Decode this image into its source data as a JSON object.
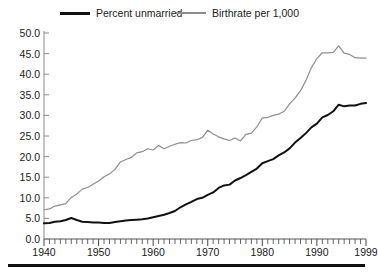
{
  "chart_data": {
    "type": "line",
    "title": "",
    "subtitle": "",
    "xlabel": "",
    "ylabel": "",
    "xlim": [
      1940,
      1999
    ],
    "ylim": [
      0.0,
      50.0
    ],
    "grid": false,
    "legend_position": "top",
    "y_ticks": [
      "50.0",
      "45.0",
      "40.0",
      "35.0",
      "30.0",
      "25.0",
      "20.0",
      "15.0",
      "10.0",
      "5.0",
      "0.0"
    ],
    "y_tick_values": [
      50.0,
      45.0,
      40.0,
      35.0,
      30.0,
      25.0,
      20.0,
      15.0,
      10.0,
      5.0,
      0.0
    ],
    "x_ticks": [
      "1940",
      "1950",
      "1960",
      "1970",
      "1980",
      "1990",
      "1999"
    ],
    "x_tick_values": [
      1940,
      1950,
      1960,
      1970,
      1980,
      1990,
      1999
    ],
    "x_minor_tick_step": 1,
    "x": [
      1940,
      1941,
      1942,
      1943,
      1944,
      1945,
      1946,
      1947,
      1948,
      1949,
      1950,
      1951,
      1952,
      1953,
      1954,
      1955,
      1956,
      1957,
      1958,
      1959,
      1960,
      1961,
      1962,
      1963,
      1964,
      1965,
      1966,
      1967,
      1968,
      1969,
      1970,
      1971,
      1972,
      1973,
      1974,
      1975,
      1976,
      1977,
      1978,
      1979,
      1980,
      1981,
      1982,
      1983,
      1984,
      1985,
      1986,
      1987,
      1988,
      1989,
      1990,
      1991,
      1992,
      1993,
      1994,
      1995,
      1996,
      1997,
      1998,
      1999
    ],
    "series": [
      {
        "name": "Percent unmarried",
        "color": "#111111",
        "width": 2.0,
        "values": [
          3.8,
          3.9,
          4.2,
          4.3,
          4.6,
          5.1,
          4.6,
          4.2,
          4.1,
          4.0,
          4.0,
          3.9,
          3.9,
          4.1,
          4.3,
          4.5,
          4.6,
          4.7,
          4.8,
          5.0,
          5.3,
          5.6,
          5.9,
          6.3,
          6.8,
          7.7,
          8.4,
          9.0,
          9.7,
          10.0,
          10.7,
          11.3,
          12.4,
          13.0,
          13.2,
          14.2,
          14.8,
          15.5,
          16.3,
          17.1,
          18.4,
          18.9,
          19.4,
          20.3,
          21.0,
          22.0,
          23.4,
          24.5,
          25.7,
          27.1,
          28.0,
          29.5,
          30.1,
          31.0,
          32.6,
          32.2,
          32.4,
          32.4,
          32.8,
          33.0
        ]
      },
      {
        "name": "Birthrate per 1,000",
        "color": "#8e8e8e",
        "width": 1.2,
        "values": [
          7.1,
          7.3,
          8.0,
          8.3,
          8.6,
          10.1,
          10.9,
          12.1,
          12.5,
          13.3,
          14.1,
          15.1,
          15.8,
          16.9,
          18.7,
          19.3,
          19.8,
          20.9,
          21.2,
          21.9,
          21.6,
          22.7,
          21.9,
          22.5,
          23.0,
          23.4,
          23.3,
          23.9,
          24.1,
          24.6,
          26.4,
          25.5,
          24.8,
          24.3,
          23.9,
          24.5,
          23.8,
          25.4,
          25.7,
          27.2,
          29.4,
          29.5,
          30.0,
          30.3,
          31.0,
          32.8,
          34.2,
          36.0,
          38.5,
          41.6,
          43.8,
          45.2,
          45.2,
          45.3,
          46.9,
          45.1,
          44.8,
          44.0,
          43.9,
          43.9
        ]
      }
    ]
  },
  "legend": {
    "entries": [
      {
        "label": "Percent unmarried"
      },
      {
        "label": "Birthrate per 1,000"
      }
    ]
  },
  "axis": {
    "y_labels": [
      "50.0",
      "45.0",
      "40.0",
      "35.0",
      "30.0",
      "25.0",
      "20.0",
      "15.0",
      "10.0",
      "5.0",
      "0.0"
    ],
    "x_labels": [
      "1940",
      "1950",
      "1960",
      "1970",
      "1980",
      "1990",
      "1999"
    ]
  }
}
